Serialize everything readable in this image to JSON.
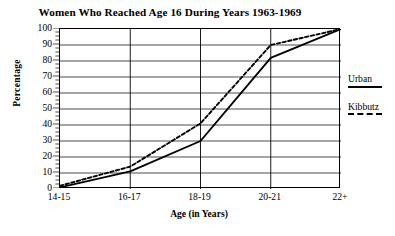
{
  "chart_data": {
    "type": "line",
    "title": "Women Who Reached Age 16 During Years 1963-1969",
    "xlabel": "Age (in Years)",
    "ylabel": "Percentage",
    "categories": [
      "14-15",
      "16-17",
      "18-19",
      "20-21",
      "22+"
    ],
    "ylim": [
      0,
      100
    ],
    "yticks": [
      0,
      10,
      20,
      30,
      40,
      50,
      60,
      70,
      80,
      90,
      100
    ],
    "ytick_labels": [
      "0",
      "10",
      "20",
      "30",
      "40",
      "50",
      "60",
      "70",
      "80",
      "90",
      "100"
    ],
    "grid": "horizontal-and-vertical",
    "legend_position": "right-outside",
    "series": [
      {
        "name": "Urban",
        "style": "solid",
        "color": "#000000",
        "values": [
          1,
          11,
          30,
          82,
          100
        ]
      },
      {
        "name": "Kibbutz",
        "style": "dashed",
        "color": "#000000",
        "values": [
          2,
          14,
          41,
          90,
          100
        ]
      }
    ]
  },
  "legend": {
    "entries": [
      {
        "label": "Urban",
        "style": "solid"
      },
      {
        "label": "Kibbutz",
        "style": "dashed"
      }
    ]
  }
}
